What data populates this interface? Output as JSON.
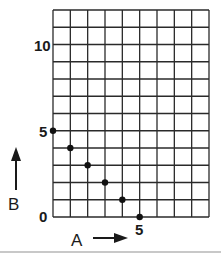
{
  "chart_data": {
    "type": "scatter",
    "title": "",
    "xlabel": "A",
    "ylabel": "B",
    "x": [
      0,
      1,
      2,
      3,
      4,
      5
    ],
    "y": [
      5,
      4,
      3,
      2,
      1,
      0
    ],
    "series": [
      {
        "name": "points",
        "x": [
          0,
          1,
          2,
          3,
          4,
          5
        ],
        "y": [
          5,
          4,
          3,
          2,
          1,
          0
        ]
      }
    ],
    "xlim": [
      0,
      9
    ],
    "ylim": [
      0,
      12
    ],
    "x_tick_labels": [
      {
        "value": 5,
        "label": "5"
      }
    ],
    "y_tick_labels": [
      {
        "value": 0,
        "label": "0"
      },
      {
        "value": 5,
        "label": "5"
      },
      {
        "value": 10,
        "label": "10"
      }
    ],
    "grid": true,
    "legend": null,
    "colors": {
      "grid": "#2a2a2a",
      "points": "#111111",
      "text": "#1a1a1a"
    }
  },
  "axes": {
    "x_label": "A",
    "y_label": "B",
    "x_tick_5": "5",
    "y_tick_0": "0",
    "y_tick_5": "5",
    "y_tick_10": "10"
  }
}
